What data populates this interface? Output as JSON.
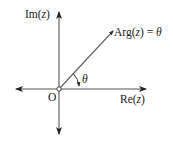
{
  "diagram": {
    "labels": {
      "im_axis": "Im(",
      "im_var": "z",
      "im_close": ")",
      "re_axis": "Re(",
      "re_var": "z",
      "re_close": ")",
      "origin": "O",
      "arg_prefix": "Arg(",
      "arg_var": "z",
      "arg_mid": ") = ",
      "arg_theta": "θ",
      "angle": "θ"
    },
    "colors": {
      "axis": "#333333",
      "ray": "#555555",
      "text": "#222222",
      "background": "#ffffff"
    }
  }
}
